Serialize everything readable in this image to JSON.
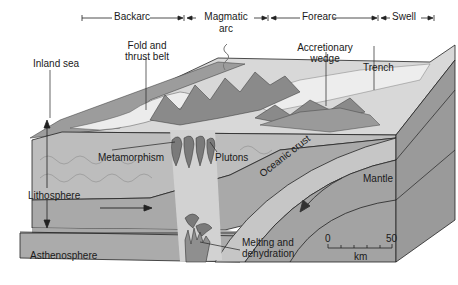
{
  "zones": {
    "backarc": "Backarc",
    "magmatic_arc_line1": "Magmatic",
    "magmatic_arc_line2": "arc",
    "forearc": "Forearc",
    "swell": "Swell"
  },
  "labels": {
    "inland_sea": "Inland sea",
    "fold_thrust_line1": "Fold and",
    "fold_thrust_line2": "thrust belt",
    "accretionary_line1": "Accretionary",
    "accretionary_line2": "wedge",
    "trench": "Trench",
    "lithosphere": "Lithosphere",
    "metamorphism": "Metamorphism",
    "plutons": "Plutons",
    "oceanic_crust": "Oceanic crust",
    "mantle": "Mantle",
    "asthenosphere": "Asthenosphere",
    "melting_line1": "Melting and",
    "melting_line2": "dehydration"
  },
  "scale_bar": {
    "min": "0",
    "max": "50",
    "unit": "km"
  },
  "colors": {
    "surface_light": "#e8e8e8",
    "lithosphere": "#bdbdbd",
    "asthenosphere": "#a9a9a9",
    "oceanic_crust": "#c6c6c6",
    "mantle": "#a3a3a3",
    "side_face": "#9a9a9a",
    "mountains": "#8a8a8a",
    "plutons": "#7a7a7a",
    "line": "#222222"
  }
}
